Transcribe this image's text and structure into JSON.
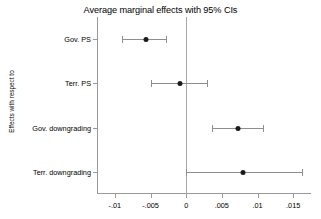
{
  "chart_data": {
    "type": "scatter",
    "title": "Average marginal effects with 95% CIs",
    "xlabel": "",
    "ylabel": "Effects with respect to",
    "orientation": "horizontal",
    "grid": false,
    "legend": "none",
    "xlim": [
      -0.0125,
      0.0175
    ],
    "xticks": [
      -0.01,
      -0.005,
      0,
      0.005,
      0.01,
      0.015
    ],
    "xticklabels": [
      "-.01",
      "-.005",
      "0",
      ".005",
      ".01",
      ".015"
    ],
    "reference_line": 0,
    "categories": [
      "Gov. PS",
      "Terr. PS",
      "Gov. downgrading",
      "Terr. downgrading"
    ],
    "values": [
      -0.0057,
      -0.0009,
      0.0072,
      0.008
    ],
    "ci_low": [
      -0.009,
      -0.005,
      0.0036,
      0.0
    ],
    "ci_high": [
      -0.0028,
      0.0029,
      0.0108,
      0.0162
    ],
    "points": [
      {
        "label": "Gov. PS",
        "estimate": -0.0057,
        "ci_low": -0.009,
        "ci_high": -0.0028
      },
      {
        "label": "Terr. PS",
        "estimate": -0.0009,
        "ci_low": -0.005,
        "ci_high": 0.0029
      },
      {
        "label": "Gov. downgrading",
        "estimate": 0.0072,
        "ci_low": 0.0036,
        "ci_high": 0.0108
      },
      {
        "label": "Terr. downgrading",
        "estimate": 0.008,
        "ci_low": 0.0,
        "ci_high": 0.0162
      }
    ],
    "colors": {
      "marker": "#1a1a1a",
      "ci": "#8e8e8e",
      "axis": "#9a9a9a",
      "reference_line": "#a8a8a8",
      "background": "#ffffff",
      "text": "#000000"
    }
  }
}
